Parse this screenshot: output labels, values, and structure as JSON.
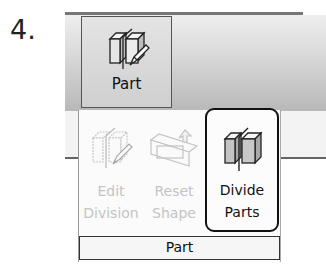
{
  "step": {
    "number": "4."
  },
  "ribbon": {
    "part_button": {
      "label": "Part",
      "icon": "part-icon",
      "state": "pressed"
    }
  },
  "dropdown": {
    "items": [
      {
        "label_line1": "Edit",
        "label_line2": "Division",
        "icon": "edit-division-icon",
        "enabled": false
      },
      {
        "label_line1": "Reset",
        "label_line2": "Shape",
        "icon": "reset-shape-icon",
        "enabled": false
      },
      {
        "label_line1": "Divide",
        "label_line2": "Parts",
        "icon": "divide-parts-icon",
        "enabled": true,
        "highlighted": true
      }
    ],
    "group_label": "Part"
  },
  "colors": {
    "highlight_border": "#111111",
    "disabled_text": "#c4c4c4",
    "ribbon_gradient_top": "#eeeeee",
    "ribbon_gradient_bottom": "#b8b8b8"
  }
}
